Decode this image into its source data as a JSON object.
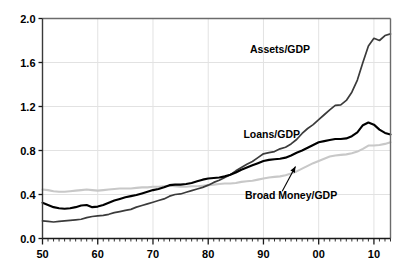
{
  "chart_data": {
    "type": "line",
    "title": "",
    "subtitle": "",
    "xlabel": "",
    "ylabel": "",
    "xlim": [
      1950,
      2013
    ],
    "ylim": [
      0.0,
      2.0
    ],
    "grid": true,
    "legend_position": "inline-annotations",
    "y_ticks": [
      "0.0",
      "0.4",
      "0.8",
      "1.2",
      "1.6",
      "2.0"
    ],
    "y_tick_values": [
      0.0,
      0.4,
      0.8,
      1.2,
      1.6,
      2.0
    ],
    "x_ticks": [
      "50",
      "60",
      "70",
      "80",
      "90",
      "00",
      "10"
    ],
    "x_tick_values": [
      1950,
      1960,
      1970,
      1980,
      1990,
      2000,
      2010
    ],
    "x_minor_tick_step": 1,
    "annotations": [
      {
        "text": "Assets/GDP",
        "x": 1993.0,
        "y": 1.69
      },
      {
        "text": "Loans/GDP",
        "x": 1991.5,
        "y": 0.91
      },
      {
        "text": "Broad Money/GDP",
        "x": 1995.0,
        "y": 0.355
      }
    ],
    "series": [
      {
        "name": "Assets/GDP",
        "color": "#3b3b3b",
        "width": 1.7,
        "x": [
          1950,
          1951,
          1952,
          1953,
          1954,
          1955,
          1956,
          1957,
          1958,
          1959,
          1960,
          1961,
          1962,
          1963,
          1964,
          1965,
          1966,
          1967,
          1968,
          1969,
          1970,
          1971,
          1972,
          1973,
          1974,
          1975,
          1976,
          1977,
          1978,
          1979,
          1980,
          1981,
          1982,
          1983,
          1984,
          1985,
          1986,
          1987,
          1988,
          1989,
          1990,
          1991,
          1992,
          1993,
          1994,
          1995,
          1996,
          1997,
          1998,
          1999,
          2000,
          2001,
          2002,
          2003,
          2004,
          2005,
          2006,
          2007,
          2008,
          2009,
          2010,
          2011,
          2012,
          2013
        ],
        "values": [
          0.16,
          0.155,
          0.15,
          0.155,
          0.16,
          0.165,
          0.17,
          0.175,
          0.19,
          0.2,
          0.205,
          0.21,
          0.22,
          0.235,
          0.245,
          0.255,
          0.265,
          0.285,
          0.3,
          0.315,
          0.33,
          0.345,
          0.36,
          0.385,
          0.4,
          0.405,
          0.42,
          0.435,
          0.45,
          0.465,
          0.485,
          0.51,
          0.53,
          0.555,
          0.58,
          0.615,
          0.645,
          0.675,
          0.7,
          0.735,
          0.77,
          0.78,
          0.79,
          0.815,
          0.83,
          0.86,
          0.9,
          0.955,
          1.0,
          1.035,
          1.08,
          1.125,
          1.17,
          1.21,
          1.215,
          1.255,
          1.33,
          1.44,
          1.6,
          1.75,
          1.82,
          1.8,
          1.845,
          1.86
        ]
      },
      {
        "name": "Loans/GDP",
        "color": "#000000",
        "width": 2.1,
        "x": [
          1950,
          1951,
          1952,
          1953,
          1954,
          1955,
          1956,
          1957,
          1958,
          1959,
          1960,
          1961,
          1962,
          1963,
          1964,
          1965,
          1966,
          1967,
          1968,
          1969,
          1970,
          1971,
          1972,
          1973,
          1974,
          1975,
          1976,
          1977,
          1978,
          1979,
          1980,
          1981,
          1982,
          1983,
          1984,
          1985,
          1986,
          1987,
          1988,
          1989,
          1990,
          1991,
          1992,
          1993,
          1994,
          1995,
          1996,
          1997,
          1998,
          1999,
          2000,
          2001,
          2002,
          2003,
          2004,
          2005,
          2006,
          2007,
          2008,
          2009,
          2010,
          2011,
          2012,
          2013
        ],
        "values": [
          0.325,
          0.305,
          0.285,
          0.275,
          0.27,
          0.275,
          0.285,
          0.3,
          0.305,
          0.285,
          0.29,
          0.305,
          0.325,
          0.345,
          0.36,
          0.375,
          0.385,
          0.395,
          0.41,
          0.425,
          0.44,
          0.45,
          0.465,
          0.485,
          0.49,
          0.49,
          0.495,
          0.505,
          0.52,
          0.535,
          0.545,
          0.55,
          0.555,
          0.565,
          0.58,
          0.6,
          0.625,
          0.645,
          0.665,
          0.685,
          0.705,
          0.715,
          0.72,
          0.725,
          0.735,
          0.755,
          0.78,
          0.8,
          0.825,
          0.85,
          0.875,
          0.885,
          0.895,
          0.905,
          0.905,
          0.91,
          0.93,
          0.965,
          1.03,
          1.055,
          1.035,
          0.99,
          0.96,
          0.945
        ]
      },
      {
        "name": "Broad Money/GDP",
        "color": "#c8c8c8",
        "width": 2.1,
        "x": [
          1950,
          1951,
          1952,
          1953,
          1954,
          1955,
          1956,
          1957,
          1958,
          1959,
          1960,
          1961,
          1962,
          1963,
          1964,
          1965,
          1966,
          1967,
          1968,
          1969,
          1970,
          1971,
          1972,
          1973,
          1974,
          1975,
          1976,
          1977,
          1978,
          1979,
          1980,
          1981,
          1982,
          1983,
          1984,
          1985,
          1986,
          1987,
          1988,
          1989,
          1990,
          1991,
          1992,
          1993,
          1994,
          1995,
          1996,
          1997,
          1998,
          1999,
          2000,
          2001,
          2002,
          2003,
          2004,
          2005,
          2006,
          2007,
          2008,
          2009,
          2010,
          2011,
          2012,
          2013
        ],
        "values": [
          0.445,
          0.44,
          0.43,
          0.425,
          0.425,
          0.43,
          0.435,
          0.44,
          0.445,
          0.44,
          0.435,
          0.44,
          0.445,
          0.45,
          0.455,
          0.455,
          0.455,
          0.46,
          0.465,
          0.465,
          0.47,
          0.47,
          0.475,
          0.48,
          0.475,
          0.47,
          0.47,
          0.475,
          0.475,
          0.48,
          0.485,
          0.49,
          0.495,
          0.5,
          0.5,
          0.505,
          0.515,
          0.52,
          0.525,
          0.535,
          0.545,
          0.555,
          0.56,
          0.565,
          0.575,
          0.59,
          0.61,
          0.635,
          0.66,
          0.685,
          0.705,
          0.725,
          0.745,
          0.755,
          0.76,
          0.765,
          0.775,
          0.79,
          0.815,
          0.845,
          0.845,
          0.85,
          0.86,
          0.875
        ]
      }
    ]
  },
  "plot": {
    "frame_color": "#6b6b6b",
    "grid_color": "#e2e2e2",
    "background": "#ffffff"
  }
}
